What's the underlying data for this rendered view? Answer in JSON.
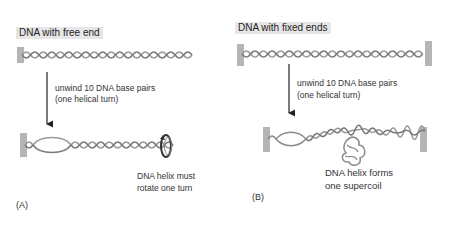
{
  "colors": {
    "background": "#ffffff",
    "label_box": "#e6e6e6",
    "helix_strand": "#9a9a9a",
    "helix_strand_dark": "#666666",
    "end_block": "#b5b5b5",
    "arrow": "#222222",
    "text": "#333333"
  },
  "panel_a": {
    "title": "DNA with free end",
    "step_line1": "unwind 10 DNA base pairs",
    "step_line2": "(one helical turn)",
    "result_line1": "DNA helix must",
    "result_line2": "rotate one turn",
    "panel_label": "(A)",
    "icons": [
      "fixed-end-block",
      "dna-helix",
      "down-arrow",
      "unwound-bubble",
      "rotation-arrow-icon"
    ]
  },
  "panel_b": {
    "title": "DNA with fixed ends",
    "step_line1": "unwind 10 DNA base pairs",
    "step_line2": "(one helical turn)",
    "result_line1": "DNA helix forms",
    "result_line2": "one supercoil",
    "panel_label": "(B)",
    "icons": [
      "fixed-end-block-left",
      "fixed-end-block-right",
      "dna-helix",
      "down-arrow",
      "unwound-bubble",
      "supercoil-loop"
    ]
  }
}
